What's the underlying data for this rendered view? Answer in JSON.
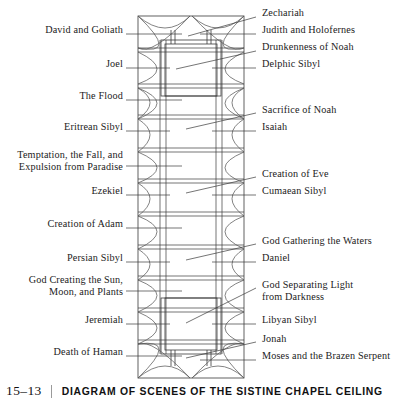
{
  "figure": {
    "number": "15–13",
    "title": "DIAGRAM OF SCENES OF THE SISTINE CHAPEL CEILING"
  },
  "diagram": {
    "type": "architectural-plan",
    "line_color": "#3a3a3a",
    "background": "#ffffff",
    "plan_bounds": {
      "x": 138,
      "y": 16,
      "width": 106,
      "height": 362
    }
  },
  "labels_left": [
    {
      "text": "David and Goliath",
      "y": 30,
      "leader_y": 34,
      "lines": 1
    },
    {
      "text": "Joel",
      "y": 64,
      "leader_y": 68,
      "lines": 1
    },
    {
      "text": "The Flood",
      "y": 96,
      "leader_y": 100,
      "lines": 1
    },
    {
      "text": "Eritrean Sibyl",
      "y": 127,
      "leader_y": 131,
      "lines": 1
    },
    {
      "text": "Temptation, the Fall, and\nExpulsion from Paradise",
      "y": 160,
      "leader_y": 166,
      "lines": 2
    },
    {
      "text": "Ezekiel",
      "y": 191,
      "leader_y": 195,
      "lines": 1
    },
    {
      "text": "Creation of Adam",
      "y": 224,
      "leader_y": 228,
      "lines": 1
    },
    {
      "text": "Persian Sibyl",
      "y": 258,
      "leader_y": 262,
      "lines": 1
    },
    {
      "text": "God Creating the Sun,\nMoon, and Plants",
      "y": 285,
      "leader_y": 291,
      "lines": 2
    },
    {
      "text": "Jeremiah",
      "y": 320,
      "leader_y": 324,
      "lines": 1
    },
    {
      "text": "Death of Haman",
      "y": 352,
      "leader_y": 356,
      "lines": 1
    }
  ],
  "labels_right": [
    {
      "text": "Zechariah",
      "y": 13,
      "leader_y": 17,
      "lines": 1
    },
    {
      "text": "Judith and Holofernes",
      "y": 30,
      "leader_y": 34,
      "lines": 1
    },
    {
      "text": "Drunkenness of Noah",
      "y": 47,
      "leader_y": 51,
      "lines": 1
    },
    {
      "text": "Delphic Sibyl",
      "y": 64,
      "leader_y": 68,
      "lines": 1
    },
    {
      "text": "Sacrifice of Noah",
      "y": 110,
      "leader_y": 114,
      "lines": 1
    },
    {
      "text": "Isaiah",
      "y": 127,
      "leader_y": 131,
      "lines": 1
    },
    {
      "text": "Creation of Eve",
      "y": 174,
      "leader_y": 178,
      "lines": 1
    },
    {
      "text": "Cumaean Sibyl",
      "y": 191,
      "leader_y": 195,
      "lines": 1
    },
    {
      "text": "God Gathering the Waters",
      "y": 241,
      "leader_y": 245,
      "lines": 1
    },
    {
      "text": "Daniel",
      "y": 258,
      "leader_y": 262,
      "lines": 1
    },
    {
      "text": "God Separating Light\nfrom Darkness",
      "y": 285,
      "leader_y": 289,
      "lines": 2
    },
    {
      "text": "Libyan Sibyl",
      "y": 320,
      "leader_y": 324,
      "lines": 1
    },
    {
      "text": "Jonah",
      "y": 339,
      "leader_y": 343,
      "lines": 1
    },
    {
      "text": "Moses and the Brazen Serpent",
      "y": 356,
      "leader_y": 360,
      "lines": 1
    }
  ]
}
